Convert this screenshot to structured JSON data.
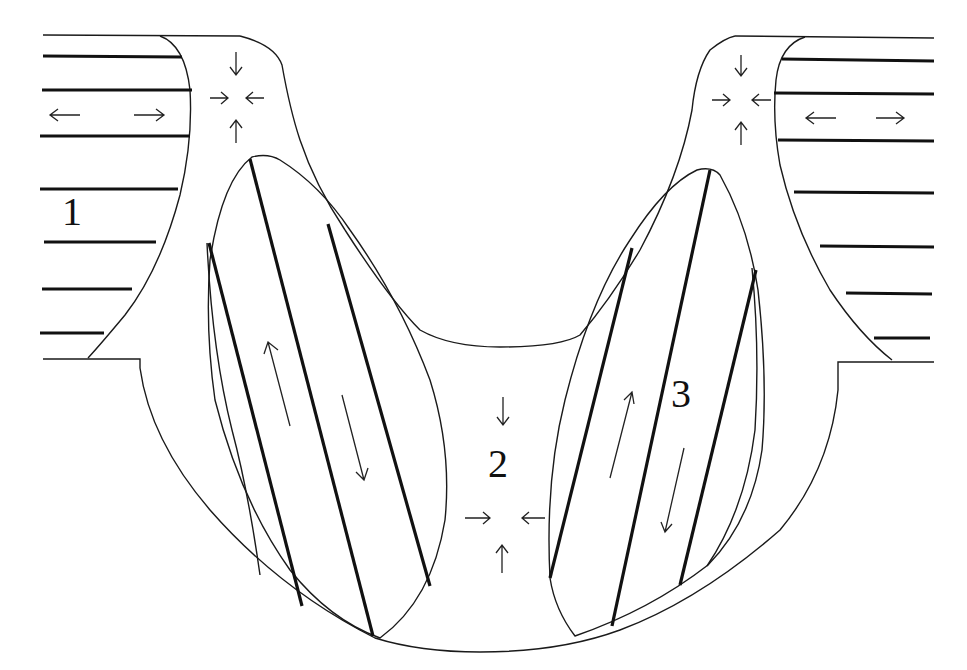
{
  "figure": {
    "type": "schematic cross-section diagram",
    "labels": [
      {
        "id": "region-1",
        "text": "1",
        "x": 62,
        "y": 192
      },
      {
        "id": "region-2",
        "text": "2",
        "x": 488,
        "y": 444
      },
      {
        "id": "region-3",
        "text": "3",
        "x": 671,
        "y": 374
      }
    ],
    "regions": {
      "region_1": "layered zone with horizontal lines, extension arrows",
      "region_2": "central compression zone (arrows converging)",
      "region_3": "inclined layered lenses with opposite-sense shear arrows"
    },
    "colors": {
      "stroke": "#111111",
      "background": "#ffffff"
    }
  }
}
